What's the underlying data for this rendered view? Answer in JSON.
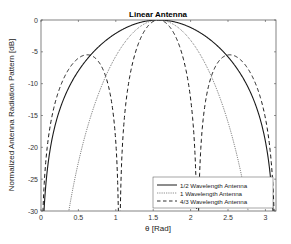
{
  "chart_data": {
    "type": "line",
    "title": "Linear Antenna",
    "xlabel": "θ [Rad]",
    "ylabel": "Normalized Antenna Radiation Pattern [dB]",
    "xlim": [
      0,
      3.1416
    ],
    "ylim": [
      -30,
      0
    ],
    "xticks": [
      0,
      0.5,
      1,
      1.5,
      2,
      2.5,
      3
    ],
    "xtick_labels": [
      "0",
      "0.5",
      "1",
      "1.5",
      "2",
      "2.5",
      "3"
    ],
    "yticks": [
      0,
      -5,
      -10,
      -15,
      -20,
      -25,
      -30
    ],
    "ytick_labels": [
      "0",
      "-5",
      "-10",
      "-15",
      "-20",
      "-25",
      "-30"
    ],
    "grid": false,
    "legend_position": "lower right",
    "x": [
      0.05,
      0.2,
      0.4,
      0.6,
      0.8,
      1.0,
      1.2,
      1.4,
      1.5708,
      1.8,
      2.0,
      2.2,
      2.4,
      2.6,
      2.8,
      3.0,
      3.09
    ],
    "series": [
      {
        "name": "1/2 Wavelength Antenna",
        "style": "solid",
        "values": [
          -30.0,
          -19.6,
          -12.5,
          -8.3,
          -5.3,
          -3.1,
          -1.4,
          -0.4,
          0.0,
          -0.6,
          -2.0,
          -4.0,
          -6.8,
          -10.6,
          -16.0,
          -25.6,
          -30.0
        ]
      },
      {
        "name": "1 Wavelength Antenna",
        "style": "dotted",
        "values": [
          -60.0,
          -43.0,
          -30.6,
          -21.8,
          -14.8,
          -9.0,
          -4.5,
          -1.5,
          0.0,
          -1.4,
          -5.0,
          -10.5,
          -18.0,
          -27.5,
          -40.0,
          -60.0,
          -60.0
        ]
      },
      {
        "name": "4/3 Wavelength Antenna",
        "style": "dashed",
        "values": [
          -33.0,
          -18.5,
          -8.7,
          -5.3,
          -9.5,
          -30.0,
          -7.0,
          -1.3,
          0.0,
          -2.2,
          -14.0,
          -9.2,
          -5.3,
          -6.5,
          -13.5,
          -27.0,
          -33.0
        ]
      }
    ]
  },
  "legend": {
    "items": [
      {
        "label": "1/2 Wavelength Antenna",
        "style": "solid"
      },
      {
        "label": "1 Wavelength Antenna",
        "style": "dotted"
      },
      {
        "label": "4/3 Wavelength Antenna",
        "style": "dashed"
      }
    ]
  },
  "colors": {
    "line": "#1a1a1a",
    "axis": "#4d4d4d",
    "tick_text": "#333333",
    "background": "#ffffff"
  }
}
